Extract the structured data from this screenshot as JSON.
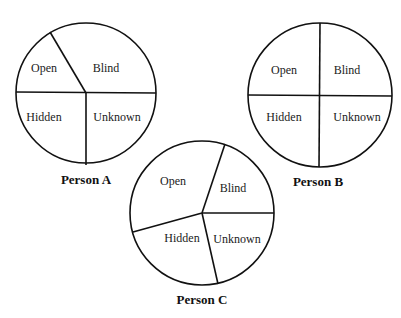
{
  "diagram": {
    "type": "johari-window-circles",
    "quadrant_labels": [
      "Open",
      "Blind",
      "Hidden",
      "Unknown"
    ],
    "persons": [
      {
        "caption": "Person A",
        "labels": {
          "open": "Open",
          "blind": "Blind",
          "hidden": "Hidden",
          "unknown": "Unknown"
        }
      },
      {
        "caption": "Person B",
        "labels": {
          "open": "Open",
          "blind": "Blind",
          "hidden": "Hidden",
          "unknown": "Unknown"
        }
      },
      {
        "caption": "Person C",
        "labels": {
          "open": "Open",
          "blind": "Blind",
          "hidden": "Hidden",
          "unknown": "Unknown"
        }
      }
    ],
    "colors": {
      "stroke": "#111111",
      "background": "#ffffff",
      "text": "#222222"
    }
  }
}
